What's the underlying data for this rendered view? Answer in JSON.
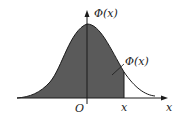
{
  "diagram": {
    "type": "normal-distribution-cdf",
    "labels": {
      "y_axis": "Φ(x)",
      "area": "Φ(x)",
      "origin": "O",
      "x_marker": "x",
      "x_axis": "x"
    },
    "colors": {
      "shade": "#5a5a5a",
      "line": "#1a1a1a",
      "background": "#ffffff"
    }
  }
}
